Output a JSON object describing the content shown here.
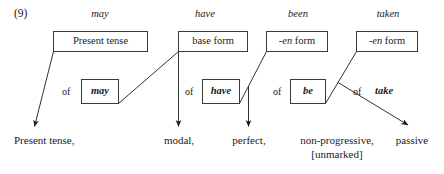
{
  "figure": {
    "number": "(9)"
  },
  "columns": [
    {
      "word": "may",
      "category_prefix": "",
      "category": "Present tense",
      "of_label": "of",
      "verb": "may",
      "verb_boxed": true,
      "gloss": "Present tense,",
      "gloss_second_line": ""
    },
    {
      "word": "have",
      "category_prefix": "",
      "category": "base form",
      "of_label": "of",
      "verb": "have",
      "verb_boxed": true,
      "gloss": "modal,",
      "gloss_second_line": ""
    },
    {
      "word": "been",
      "category_prefix": "-en",
      "category": "form",
      "of_label": "of",
      "verb": "be",
      "verb_boxed": true,
      "gloss": "perfect,",
      "gloss_second_line": ""
    },
    {
      "word": "taken",
      "category_prefix": "-en",
      "category": "form",
      "of_label": "of",
      "verb": "take",
      "verb_boxed": false,
      "gloss": "non-progressive,",
      "gloss_second_line": "[unmarked]"
    }
  ],
  "extra_gloss": {
    "passive": "passive"
  },
  "style": {
    "ink": "#1a1a1a",
    "rule": "#3a3a3a",
    "paper": "#ffffff"
  }
}
